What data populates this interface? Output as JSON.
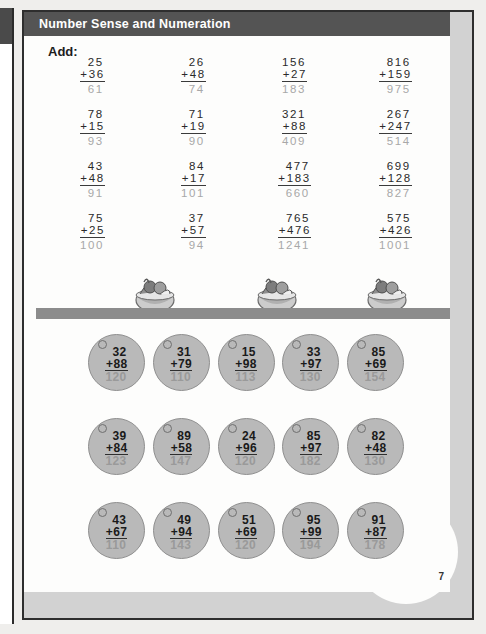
{
  "document": {
    "header_title": "Number Sense and Numeration",
    "instruction": "Add:",
    "page_number": "7",
    "colors": {
      "header_band": "#545454",
      "answer_grey": "#a8a8a8",
      "bubble_fill": "#b9b9b9",
      "divider_bar": "#8c8c8c",
      "margin_strip": "#d2d2d2"
    }
  },
  "vertical_problems": {
    "rows": [
      [
        {
          "addend1": "25",
          "addend2": "+36",
          "answer": "61"
        },
        {
          "addend1": "26",
          "addend2": "+48",
          "answer": "74"
        },
        {
          "addend1": "156",
          "addend2": "+27",
          "answer": "183"
        },
        {
          "addend1": "816",
          "addend2": "+159",
          "answer": "975"
        }
      ],
      [
        {
          "addend1": "78",
          "addend2": "+15",
          "answer": "93"
        },
        {
          "addend1": "71",
          "addend2": "+19",
          "answer": "90"
        },
        {
          "addend1": "321",
          "addend2": "+88",
          "answer": "409"
        },
        {
          "addend1": "267",
          "addend2": "+247",
          "answer": "514"
        }
      ],
      [
        {
          "addend1": "43",
          "addend2": "+48",
          "answer": "91"
        },
        {
          "addend1": "84",
          "addend2": "+17",
          "answer": "101"
        },
        {
          "addend1": "477",
          "addend2": "+183",
          "answer": "660"
        },
        {
          "addend1": "699",
          "addend2": "+128",
          "answer": "827"
        }
      ],
      [
        {
          "addend1": "75",
          "addend2": "+25",
          "answer": "100"
        },
        {
          "addend1": "37",
          "addend2": "+57",
          "answer": "94"
        },
        {
          "addend1": "765",
          "addend2": "+476",
          "answer": "1241"
        },
        {
          "addend1": "575",
          "addend2": "+426",
          "answer": "1001"
        }
      ]
    ]
  },
  "illustrations": {
    "name": "ice-cream-sundae-bowl",
    "count": 3
  },
  "bubble_problems": {
    "rows": [
      [
        {
          "addend1": "32",
          "addend2": "+88",
          "answer": "120"
        },
        {
          "addend1": "31",
          "addend2": "+79",
          "answer": "110"
        },
        {
          "addend1": "15",
          "addend2": "+98",
          "answer": "113"
        },
        {
          "addend1": "33",
          "addend2": "+97",
          "answer": "130"
        },
        {
          "addend1": "85",
          "addend2": "+69",
          "answer": "154"
        }
      ],
      [
        {
          "addend1": "39",
          "addend2": "+84",
          "answer": "123"
        },
        {
          "addend1": "89",
          "addend2": "+58",
          "answer": "147"
        },
        {
          "addend1": "24",
          "addend2": "+96",
          "answer": "120"
        },
        {
          "addend1": "85",
          "addend2": "+97",
          "answer": "182"
        },
        {
          "addend1": "82",
          "addend2": "+48",
          "answer": "130"
        }
      ],
      [
        {
          "addend1": "43",
          "addend2": "+67",
          "answer": "110"
        },
        {
          "addend1": "49",
          "addend2": "+94",
          "answer": "143"
        },
        {
          "addend1": "51",
          "addend2": "+69",
          "answer": "120"
        },
        {
          "addend1": "95",
          "addend2": "+99",
          "answer": "194"
        },
        {
          "addend1": "91",
          "addend2": "+87",
          "answer": "178"
        }
      ]
    ]
  }
}
